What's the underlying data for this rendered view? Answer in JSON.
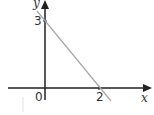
{
  "diagram": {
    "type": "coordinate-graph",
    "axes": {
      "x_label": "x",
      "y_label": "y"
    },
    "origin_label": "0",
    "y_intercept_label": "3",
    "x_intercept_label": "2",
    "line": {
      "from": [
        0,
        3
      ],
      "to": [
        2,
        0
      ],
      "color": "#a0a0a0"
    },
    "axis_color": "#222222"
  }
}
